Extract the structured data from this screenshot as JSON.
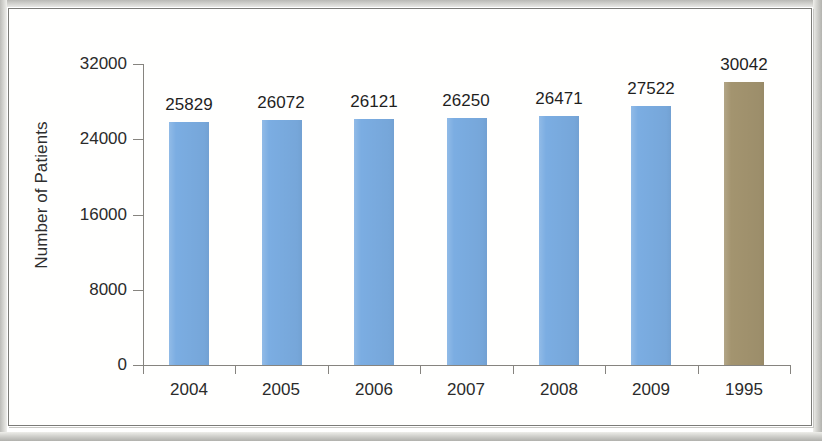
{
  "chart_data": {
    "type": "bar",
    "title": "",
    "subtitle": "",
    "xlabel": "",
    "ylabel": "Number of Patients",
    "categories": [
      "2004",
      "2005",
      "2006",
      "2007",
      "2008",
      "2009",
      "1995"
    ],
    "values": [
      25829,
      26072,
      26121,
      26250,
      26471,
      27522,
      30042
    ],
    "data_labels": [
      "25829",
      "26072",
      "26121",
      "26250",
      "26471",
      "27522",
      "30042"
    ],
    "series": [
      {
        "name": "Number of Patients",
        "values": [
          25829,
          26072,
          26121,
          26250,
          26471,
          27522,
          30042
        ]
      }
    ],
    "bar_colors": [
      "#7BADE2",
      "#7BADE2",
      "#7BADE2",
      "#7BADE2",
      "#7BADE2",
      "#7BADE2",
      "#A3946F"
    ],
    "highlight_category": "1995",
    "highlight_color": "#A3946F",
    "primary_color": "#7BADE2",
    "ylim": [
      0,
      32000
    ],
    "ytick_values": [
      0,
      8000,
      16000,
      24000,
      32000
    ],
    "ytick_labels": [
      "0",
      "8000",
      "16000",
      "24000",
      "32000"
    ],
    "grid": false,
    "legend": null,
    "legend_position": "none",
    "axis_color": "#86847F",
    "background_color": "#FFFFFF"
  }
}
